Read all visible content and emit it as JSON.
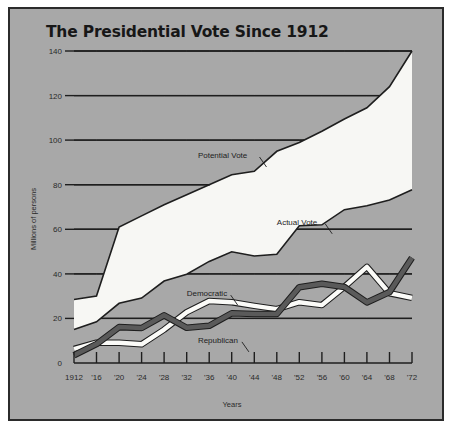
{
  "figure": {
    "title": "The Presidential Vote Since 1912",
    "background_color": "#a8a8a8",
    "border_color": "#2b2b2b",
    "fill_color": "#f7f7f4",
    "caption": ""
  },
  "chart_data": {
    "type": "area",
    "title": "The Presidential Vote Since 1912",
    "xlabel": "Years",
    "ylabel": "Millions of persons",
    "ylim": [
      0,
      140
    ],
    "xlim": [
      1912,
      1972
    ],
    "grid": true,
    "legend_position": "inline-annotations",
    "x": [
      1912,
      1916,
      1920,
      1924,
      1928,
      1932,
      1936,
      1940,
      1944,
      1948,
      1952,
      1956,
      1960,
      1964,
      1968,
      1972
    ],
    "xtick_labels": [
      "1912",
      "'16",
      "'20",
      "'24",
      "'28",
      "'32",
      "'36",
      "'40",
      "'44",
      "'48",
      "'52",
      "'56",
      "'60",
      "'64",
      "'68",
      "'72"
    ],
    "ytick_labels": [
      "0",
      "20",
      "40",
      "60",
      "80",
      "100",
      "120",
      "140"
    ],
    "ytick_values": [
      0,
      20,
      40,
      60,
      80,
      100,
      120,
      140
    ],
    "series": [
      {
        "name": "Potential Vote",
        "style": "area-upper-boundary",
        "values": [
          28.5,
          30.0,
          61.0,
          66.0,
          71.0,
          75.5,
          80.0,
          84.5,
          86.0,
          95.0,
          99.0,
          104.0,
          109.5,
          114.5,
          124.0,
          140.0
        ]
      },
      {
        "name": "Actual Vote",
        "style": "area-lower-boundary",
        "values": [
          15.0,
          18.5,
          26.8,
          29.1,
          36.8,
          39.8,
          45.6,
          49.9,
          48.0,
          48.8,
          61.6,
          62.0,
          68.8,
          70.6,
          73.2,
          77.7
        ]
      },
      {
        "name": "Democratic",
        "style": "white-band",
        "values": [
          6.3,
          9.1,
          9.1,
          8.4,
          15.0,
          22.8,
          27.8,
          27.3,
          25.6,
          24.2,
          27.3,
          26.0,
          34.2,
          43.1,
          31.3,
          29.2
        ]
      },
      {
        "name": "Republican",
        "style": "dark-band",
        "values": [
          3.5,
          8.5,
          16.1,
          15.7,
          21.4,
          15.8,
          16.7,
          22.3,
          22.0,
          22.0,
          34.0,
          35.6,
          34.1,
          27.2,
          31.8,
          47.2
        ]
      }
    ],
    "annotations": [
      {
        "text": "Potential Vote",
        "year": 1934,
        "value": 92
      },
      {
        "text": "Actual Vote",
        "year": 1948,
        "value": 62
      },
      {
        "text": "Democratic",
        "year": 1932,
        "value": 30
      },
      {
        "text": "Republican",
        "year": 1934,
        "value": 9
      }
    ]
  }
}
